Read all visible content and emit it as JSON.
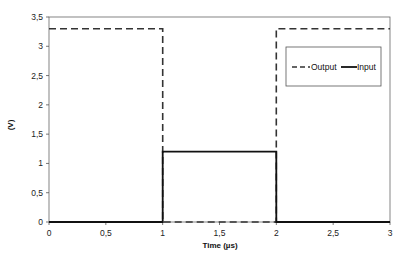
{
  "chart_data": {
    "type": "line",
    "title": "",
    "xlabel": "Time (µs)",
    "ylabel": "(V)",
    "xlim": [
      0,
      3
    ],
    "ylim": [
      0,
      3.5
    ],
    "x_ticks": [
      "0",
      "0,5",
      "1",
      "1,5",
      "2",
      "2,5",
      "3"
    ],
    "y_ticks": [
      "0",
      "0,5",
      "1",
      "1,5",
      "2",
      "2,5",
      "3",
      "3,5"
    ],
    "grid": false,
    "legend_position": "upper right (inside plot)",
    "series": [
      {
        "name": "Output",
        "style": "dashed",
        "color": "#333333",
        "x": [
          0,
          1,
          1,
          2,
          2,
          3
        ],
        "y": [
          3.3,
          3.3,
          0,
          0,
          3.3,
          3.3
        ]
      },
      {
        "name": "Input",
        "style": "solid",
        "color": "#111111",
        "x": [
          0,
          1,
          1,
          2,
          2,
          3
        ],
        "y": [
          0,
          0,
          1.2,
          1.2,
          0,
          0
        ]
      }
    ]
  },
  "legend": {
    "items": [
      {
        "label": "Output"
      },
      {
        "label": "Input"
      }
    ]
  }
}
